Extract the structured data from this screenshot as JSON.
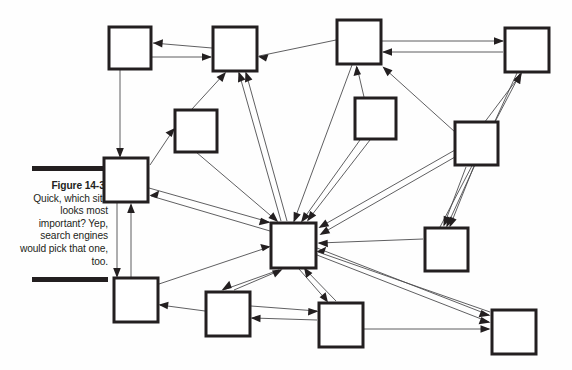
{
  "page": {
    "background_color": "#ffffff",
    "width": 572,
    "height": 370
  },
  "caption": {
    "rule_color": "#231f20",
    "figure_label": "Figure 14-3:",
    "body_text": "Quick, which site looks most important? Yep, search engines would pick that one, too.",
    "lines": [
      "Quick,",
      "which site",
      "looks most",
      "important?",
      "Yep, search",
      "engines",
      "would pick",
      "that one,",
      "too."
    ]
  },
  "diagram": {
    "type": "directed-graph",
    "node_fill": "#ffffff",
    "node_stroke": "#231f20",
    "edge_stroke": "#4d4d4f",
    "node_size": 42,
    "hub_node_id": "hub",
    "nodes": [
      {
        "id": "n1",
        "label": "",
        "x": 109,
        "y": 27,
        "w": 42,
        "h": 42
      },
      {
        "id": "n2",
        "label": "",
        "x": 213,
        "y": 27,
        "w": 44,
        "h": 44
      },
      {
        "id": "n3",
        "label": "",
        "x": 337,
        "y": 20,
        "w": 44,
        "h": 44
      },
      {
        "id": "n4",
        "label": "",
        "x": 505,
        "y": 28,
        "w": 44,
        "h": 44
      },
      {
        "id": "n5",
        "label": "",
        "x": 175,
        "y": 110,
        "w": 42,
        "h": 42
      },
      {
        "id": "n6",
        "label": "",
        "x": 355,
        "y": 98,
        "w": 41,
        "h": 41
      },
      {
        "id": "n7",
        "label": "",
        "x": 455,
        "y": 122,
        "w": 43,
        "h": 43
      },
      {
        "id": "n8",
        "label": "",
        "x": 104,
        "y": 158,
        "w": 44,
        "h": 44
      },
      {
        "id": "hub",
        "label": "",
        "x": 271,
        "y": 223,
        "w": 45,
        "h": 45
      },
      {
        "id": "n9",
        "label": "",
        "x": 425,
        "y": 228,
        "w": 43,
        "h": 43
      },
      {
        "id": "n10",
        "label": "",
        "x": 114,
        "y": 278,
        "w": 44,
        "h": 44
      },
      {
        "id": "n11",
        "label": "",
        "x": 206,
        "y": 292,
        "w": 44,
        "h": 44
      },
      {
        "id": "n12",
        "label": "",
        "x": 319,
        "y": 303,
        "w": 44,
        "h": 44
      },
      {
        "id": "n13",
        "label": "",
        "x": 492,
        "y": 310,
        "w": 44,
        "h": 44
      }
    ],
    "edges": [
      {
        "from": "n2",
        "to": "n1"
      },
      {
        "from": "n1",
        "to": "n2"
      },
      {
        "from": "n3",
        "to": "n2"
      },
      {
        "from": "n3",
        "to": "n4"
      },
      {
        "from": "n4",
        "to": "n3"
      },
      {
        "from": "n1",
        "to": "n8"
      },
      {
        "from": "n5",
        "to": "n2"
      },
      {
        "from": "n8",
        "to": "n5"
      },
      {
        "from": "hub",
        "to": "n2"
      },
      {
        "from": "hub",
        "to": "n2b"
      },
      {
        "from": "n3",
        "to": "hub_down"
      },
      {
        "from": "n6",
        "to": "n3"
      },
      {
        "from": "n7",
        "to": "n3"
      },
      {
        "from": "n9",
        "to": "n4"
      },
      {
        "from": "n7",
        "to": "n4"
      },
      {
        "from": "n4",
        "to": "n9"
      },
      {
        "from": "n7",
        "to": "n9"
      },
      {
        "from": "n8",
        "to": "n10"
      },
      {
        "from": "n10",
        "to": "n8"
      },
      {
        "from": "hub",
        "to": "n8"
      },
      {
        "from": "n8",
        "to": "hub"
      },
      {
        "from": "n10",
        "to": "hub"
      },
      {
        "from": "n11",
        "to": "n10"
      },
      {
        "from": "hub",
        "to": "n11"
      },
      {
        "from": "n11",
        "to": "hub"
      },
      {
        "from": "n11",
        "to": "n12"
      },
      {
        "from": "n12",
        "to": "n11"
      },
      {
        "from": "hub",
        "to": "n12"
      },
      {
        "from": "n12",
        "to": "hub"
      },
      {
        "from": "n12",
        "to": "n13"
      },
      {
        "from": "hub",
        "to": "n13"
      },
      {
        "from": "n9",
        "to": "hub"
      },
      {
        "from": "n7",
        "to": "hub"
      },
      {
        "from": "n6",
        "to": "hub"
      },
      {
        "from": "n5",
        "to": "hub"
      },
      {
        "from": "n13",
        "to": "hub"
      }
    ],
    "inbound_counts": {
      "hub": 12,
      "n2": 4,
      "n3": 3,
      "n4": 3
    }
  }
}
